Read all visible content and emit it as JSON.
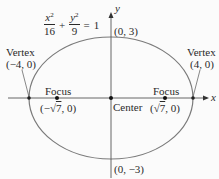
{
  "diagram": {
    "type": "ellipse",
    "equation": {
      "term1_num_var": "x",
      "term1_num_exp": "2",
      "term1_den": "16",
      "plus": "+",
      "term2_num_var": "y",
      "term2_num_exp": "2",
      "term2_den": "9",
      "equals": "=",
      "rhs": "1"
    },
    "axes": {
      "x_label": "x",
      "y_label": "y"
    },
    "center": {
      "label": "Center"
    },
    "top_point": {
      "label": "(0, 3)"
    },
    "bottom_point": {
      "label": "(0, −3)"
    },
    "left_vertex": {
      "title": "Vertex",
      "coords": "(−4, 0)"
    },
    "right_vertex": {
      "title": "Vertex",
      "coords": "(4, 0)"
    },
    "left_focus": {
      "title": "Focus",
      "coords_prefix": "(−",
      "coords_root": "7",
      "coords_suffix": ", 0)"
    },
    "right_focus": {
      "title": "Focus",
      "coords_prefix": "(",
      "coords_root": "7",
      "coords_suffix": ", 0)"
    },
    "colors": {
      "ellipse": "#7a7a7a",
      "axes": "#555555",
      "text": "#2a2a2a",
      "points": "#111111"
    }
  }
}
